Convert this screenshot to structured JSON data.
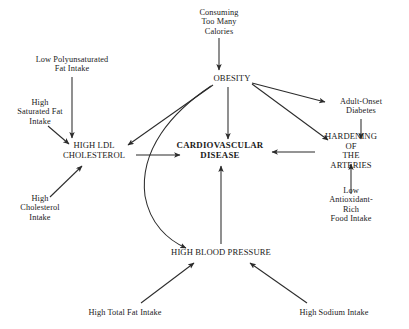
{
  "diagram": {
    "background_color": "#ffffff",
    "line_color": "#2b2b2b",
    "text_color": "#1a1a1a",
    "nodes": [
      {
        "id": "consuming-too-many-calories",
        "label": "Consuming\nToo Many\nCalories",
        "x": 219,
        "y": 22,
        "style": "node-sm"
      },
      {
        "id": "obesity",
        "label": "OBESITY",
        "x": 232,
        "y": 79,
        "style": "node-caps"
      },
      {
        "id": "low-polyunsaturated-fat-intake",
        "label": "Low Polyunsaturated\nFat Intake",
        "x": 72,
        "y": 64,
        "style": "node-sm"
      },
      {
        "id": "high-saturated-fat-intake",
        "label": "High\nSaturated Fat\nIntake",
        "x": 40,
        "y": 112,
        "style": "node-sm"
      },
      {
        "id": "high-ldl-cholesterol",
        "label": "HIGH LDL\nCHOLESTEROL",
        "x": 94,
        "y": 151,
        "style": "node-caps"
      },
      {
        "id": "high-cholesterol-intake",
        "label": "High\nCholesterol\nIntake",
        "x": 40,
        "y": 208,
        "style": "node-sm"
      },
      {
        "id": "cardiovascular-disease",
        "label": "CARDIOVASCULAR\nDISEASE",
        "x": 220,
        "y": 151,
        "style": "node-main"
      },
      {
        "id": "adult-onset-diabetes",
        "label": "Adult-Onset\nDiabetes",
        "x": 361,
        "y": 106,
        "style": "node-sm"
      },
      {
        "id": "hardening-of-the-arteries",
        "label": "HARDENING OF\nTHE ARTERIES",
        "x": 351,
        "y": 151,
        "style": "node-caps"
      },
      {
        "id": "low-antioxidant-rich-food-intake",
        "label": "Low Antioxidant-Rich\nFood Intake",
        "x": 351,
        "y": 205,
        "style": "node-sm"
      },
      {
        "id": "high-blood-pressure",
        "label": "HIGH BLOOD PRESSURE",
        "x": 221,
        "y": 253,
        "style": "node-caps"
      },
      {
        "id": "high-total-fat-intake",
        "label": "High Total Fat Intake",
        "x": 125,
        "y": 313,
        "style": "node-sm"
      },
      {
        "id": "high-sodium-intake",
        "label": "High Sodium Intake",
        "x": 334,
        "y": 313,
        "style": "node-sm"
      }
    ],
    "edges": [
      {
        "id": "calories-to-obesity",
        "from": "consuming-too-many-calories",
        "to": "obesity"
      },
      {
        "id": "low-polyunsaturated-to-ldl",
        "from": "low-polyunsaturated-fat-intake",
        "to": "high-ldl-cholesterol"
      },
      {
        "id": "saturated-fat-to-ldl",
        "from": "high-saturated-fat-intake",
        "to": "high-ldl-cholesterol"
      },
      {
        "id": "cholesterol-intake-to-ldl",
        "from": "high-cholesterol-intake",
        "to": "high-ldl-cholesterol"
      },
      {
        "id": "obesity-to-ldl",
        "from": "obesity",
        "to": "high-ldl-cholesterol"
      },
      {
        "id": "obesity-to-blood-pressure",
        "from": "obesity",
        "to": "high-blood-pressure",
        "shape": "curved"
      },
      {
        "id": "obesity-to-cardiovascular-disease",
        "from": "obesity",
        "to": "cardiovascular-disease"
      },
      {
        "id": "obesity-to-diabetes",
        "from": "obesity",
        "to": "adult-onset-diabetes"
      },
      {
        "id": "obesity-to-hardening",
        "from": "obesity",
        "to": "hardening-of-the-arteries"
      },
      {
        "id": "diabetes-to-hardening",
        "from": "adult-onset-diabetes",
        "to": "hardening-of-the-arteries"
      },
      {
        "id": "ldl-to-cardiovascular-disease",
        "from": "high-ldl-cholesterol",
        "to": "cardiovascular-disease"
      },
      {
        "id": "hardening-to-cardiovascular-disease",
        "from": "hardening-of-the-arteries",
        "to": "cardiovascular-disease"
      },
      {
        "id": "antioxidant-to-hardening",
        "from": "low-antioxidant-rich-food-intake",
        "to": "hardening-of-the-arteries"
      },
      {
        "id": "blood-pressure-to-cardiovascular-disease",
        "from": "high-blood-pressure",
        "to": "cardiovascular-disease"
      },
      {
        "id": "total-fat-to-blood-pressure",
        "from": "high-total-fat-intake",
        "to": "high-blood-pressure"
      },
      {
        "id": "sodium-to-blood-pressure",
        "from": "high-sodium-intake",
        "to": "high-blood-pressure"
      }
    ]
  }
}
